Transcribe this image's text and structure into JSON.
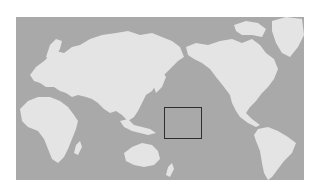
{
  "map": {
    "projection": "pacific-centered world map",
    "colors": {
      "ocean": "#a9a9a9",
      "land": "#e4e4e4",
      "highlight_border": "#2e2e2e",
      "background": "#ffffff"
    },
    "landmasses": [
      "Europe",
      "Asia",
      "Africa",
      "Australia",
      "New Zealand",
      "North America",
      "Greenland",
      "South America"
    ],
    "highlight_region": {
      "label": "central Pacific Ocean highlight box",
      "left": 164,
      "top": 107,
      "width": 38,
      "height": 32
    }
  }
}
